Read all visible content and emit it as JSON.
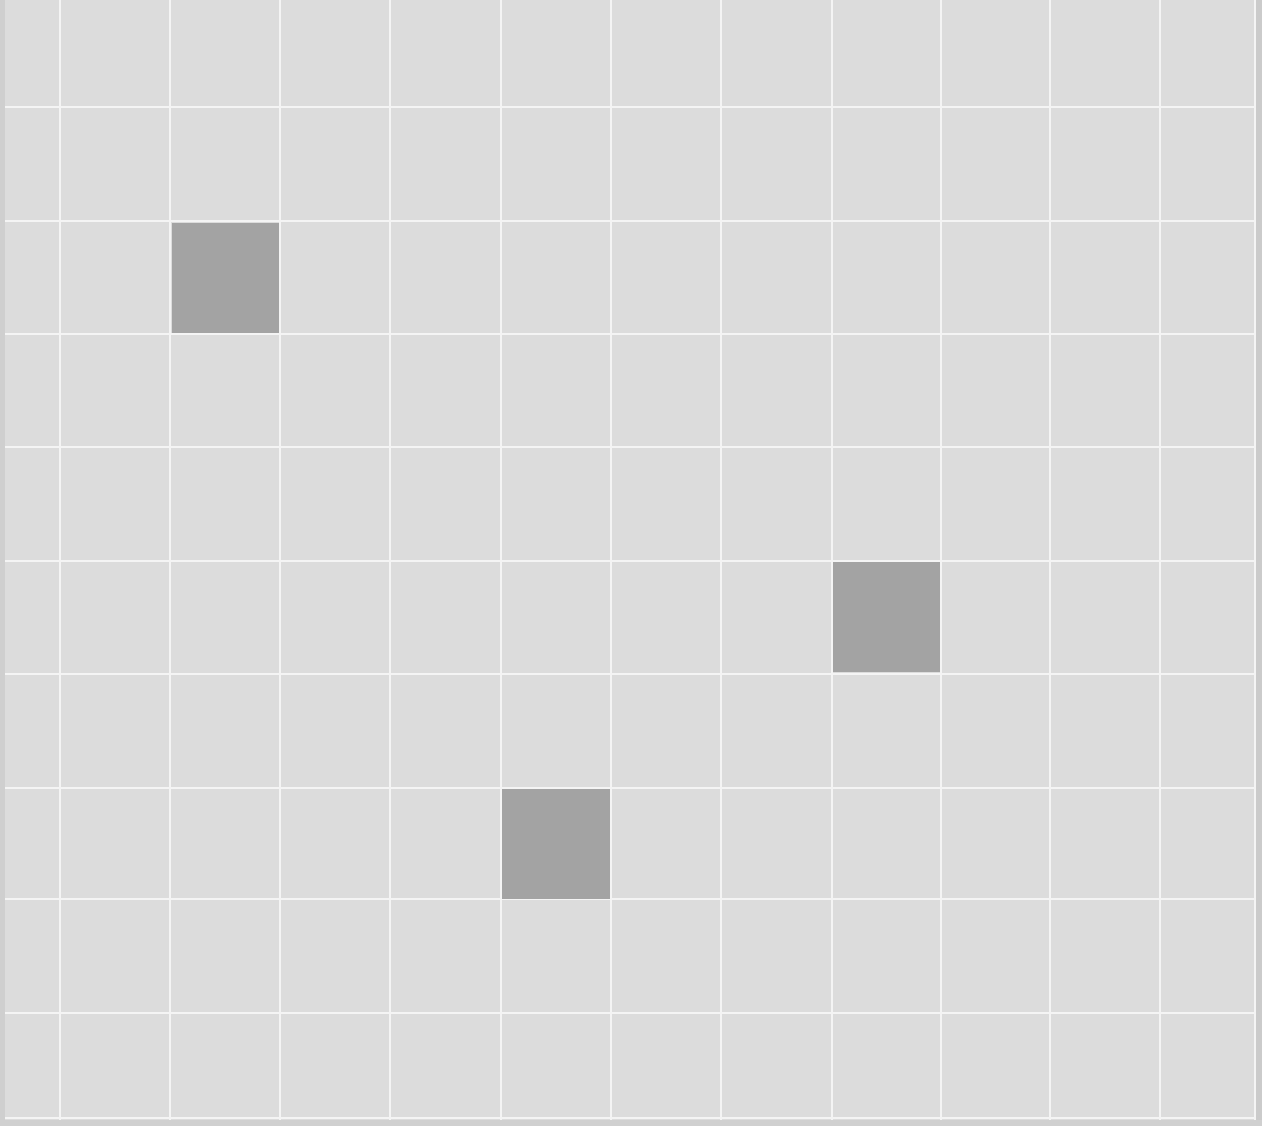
{
  "board": {
    "background_color": "#dcdcdc",
    "gridline_color": "#f4f4f4",
    "filled_color": "#a3a3a3",
    "vertical_lines_x": [
      60,
      170,
      280,
      390,
      501,
      611,
      721,
      832,
      941,
      1050,
      1160,
      1255
    ],
    "horizontal_lines_y": [
      107,
      221,
      334,
      447,
      561,
      674,
      788,
      899,
      1013,
      1118
    ],
    "filled_cells": [
      {
        "col": 2,
        "row": 2,
        "x": 172,
        "y": 223,
        "w": 107,
        "h": 110
      },
      {
        "col": 8,
        "row": 5,
        "x": 833,
        "y": 562,
        "w": 107,
        "h": 110
      },
      {
        "col": 5,
        "row": 7,
        "x": 502,
        "y": 789,
        "w": 108,
        "h": 110
      }
    ]
  }
}
